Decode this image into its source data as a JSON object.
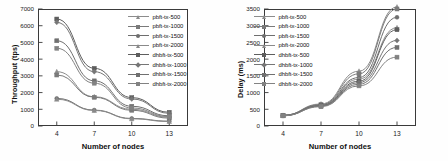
{
  "figure": {
    "background": "#ffffff",
    "axis_color": "#3a3a3a"
  },
  "chart_data": [
    {
      "id": "throughput",
      "type": "line",
      "title": "",
      "xlabel": "Number of nodes",
      "ylabel": "Throughput (tps)",
      "x": [
        4,
        7,
        10,
        13
      ],
      "xticks": [
        "4",
        "7",
        "10",
        "13"
      ],
      "yticks": [
        "0",
        "1000",
        "2000",
        "3000",
        "4000",
        "5000",
        "6000",
        "7000"
      ],
      "xlim": [
        2.5,
        14.5
      ],
      "ylim": [
        0,
        7000
      ],
      "grid": false,
      "legend_position": "upper right",
      "series": [
        {
          "name": "pbft-tx-500",
          "marker": "triangle-up",
          "color": "#8c8c8c",
          "values": [
            3250,
            1750,
            1000,
            520
          ]
        },
        {
          "name": "pbft-tx-1000",
          "marker": "square",
          "color": "#7a7a7a",
          "values": [
            3050,
            1720,
            940,
            470
          ]
        },
        {
          "name": "pbft-tx-1500",
          "marker": "circle",
          "color": "#6e6e6e",
          "values": [
            1650,
            950,
            450,
            290
          ]
        },
        {
          "name": "pbft-tx-2000",
          "marker": "triangle-up",
          "color": "#8a8a8a",
          "values": [
            1600,
            930,
            430,
            270
          ]
        },
        {
          "name": "dhbft-tx-500",
          "marker": "square",
          "color": "#5e5e5e",
          "values": [
            6400,
            3450,
            1700,
            820
          ]
        },
        {
          "name": "dhbft-tx-1000",
          "marker": "diamond",
          "color": "#767676",
          "values": [
            6200,
            3250,
            1620,
            760
          ]
        },
        {
          "name": "dhbft-tx-1500",
          "marker": "square",
          "color": "#707070",
          "values": [
            5100,
            2700,
            1180,
            610
          ]
        },
        {
          "name": "dhbft-tx-2000",
          "marker": "square",
          "color": "#828282",
          "values": [
            4650,
            2560,
            1080,
            560
          ]
        }
      ]
    },
    {
      "id": "delay",
      "type": "line",
      "title": "",
      "xlabel": "Number of nodes",
      "ylabel": "Delay (ms)",
      "x": [
        4,
        7,
        10,
        13
      ],
      "xticks": [
        "4",
        "7",
        "10",
        "13"
      ],
      "yticks": [
        "0",
        "500",
        "1000",
        "1500",
        "2000",
        "2500",
        "3000",
        "3500"
      ],
      "xlim": [
        2.5,
        14.5
      ],
      "ylim": [
        0,
        3500
      ],
      "grid": false,
      "legend_position": "upper left",
      "series": [
        {
          "name": "pbft-tx-500",
          "marker": "triangle-up",
          "color": "#8c8c8c",
          "values": [
            320,
            660,
            1640,
            3560
          ]
        },
        {
          "name": "pbft-tx-1000",
          "marker": "square",
          "color": "#7a7a7a",
          "values": [
            320,
            640,
            1560,
            3500
          ]
        },
        {
          "name": "pbft-tx-1500",
          "marker": "circle",
          "color": "#6e6e6e",
          "values": [
            315,
            630,
            1450,
            3250
          ]
        },
        {
          "name": "pbft-tx-2000",
          "marker": "triangle-up",
          "color": "#8a8a8a",
          "values": [
            315,
            620,
            1400,
            2940
          ]
        },
        {
          "name": "dhbft-tx-500",
          "marker": "square",
          "color": "#5e5e5e",
          "values": [
            310,
            610,
            1340,
            2880
          ]
        },
        {
          "name": "dhbft-tx-1000",
          "marker": "diamond",
          "color": "#767676",
          "values": [
            310,
            600,
            1300,
            2560
          ]
        },
        {
          "name": "dhbft-tx-1500",
          "marker": "square",
          "color": "#707070",
          "values": [
            305,
            590,
            1250,
            2350
          ]
        },
        {
          "name": "dhbft-tx-2000",
          "marker": "square",
          "color": "#828282",
          "values": [
            305,
            580,
            1200,
            2060
          ]
        }
      ]
    }
  ]
}
